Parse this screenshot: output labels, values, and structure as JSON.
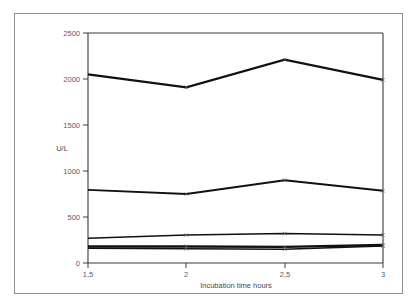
{
  "chart_data": {
    "type": "line",
    "title": "",
    "xlabel": "Incubation time hours",
    "ylabel": "U/L",
    "x": [
      1.5,
      2,
      2.5,
      3
    ],
    "categories": [
      "1,5",
      "2",
      "2,5",
      "3"
    ],
    "xtick_labels": [
      "1,5",
      "2",
      "2,5",
      "3"
    ],
    "ytick_labels": [
      "0",
      "500",
      "1000",
      "1500",
      "2000",
      "2500"
    ],
    "ytick_values": [
      0,
      500,
      1000,
      1500,
      2000,
      2500
    ],
    "ylim": [
      0,
      2500
    ],
    "xlim": [
      1.5,
      3
    ],
    "grid": false,
    "legend": "none",
    "series": [
      {
        "name": "series-1",
        "values": [
          2050,
          1910,
          2210,
          1990
        ]
      },
      {
        "name": "series-2",
        "values": [
          795,
          750,
          900,
          785
        ]
      },
      {
        "name": "series-3",
        "values": [
          270,
          305,
          320,
          305
        ]
      },
      {
        "name": "series-4",
        "values": [
          180,
          180,
          175,
          195
        ]
      },
      {
        "name": "series-5",
        "values": [
          160,
          155,
          150,
          185
        ]
      }
    ]
  },
  "axis": {
    "y_title": "U/L",
    "x_title": "Incubation time hours",
    "y_ticks": [
      "2500",
      "2000",
      "1500",
      "1000",
      "500",
      "0"
    ],
    "x_ticks": [
      "1,5",
      "2",
      "2,5",
      "3"
    ]
  },
  "colors": {
    "line": "#111111",
    "axis": "#3a3a40",
    "text": "#5a5a60",
    "frame": "#8f8f96",
    "background": "#ffffff"
  }
}
